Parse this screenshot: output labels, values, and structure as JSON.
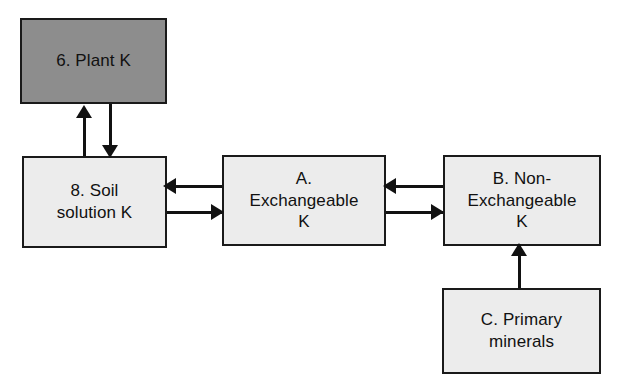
{
  "diagram": {
    "canvas": {
      "width": 622,
      "height": 390,
      "background": "#ffffff"
    },
    "palette": {
      "node_fill_plain": "#ececec",
      "node_fill_shaded": "#8d8d8d",
      "node_border": "#1a1a1a",
      "connector": "#111111",
      "text": "#111111"
    },
    "nodes": [
      {
        "id": "plant",
        "label": "6. Plant  K",
        "fill": "shaded"
      },
      {
        "id": "soil",
        "label": "8. Soil\nsolution K",
        "fill": "plain"
      },
      {
        "id": "exchangeable",
        "label": "A.\nExchangeable\nK",
        "fill": "plain"
      },
      {
        "id": "nonexchangeable",
        "label": "B. Non-\nExchangeable\nK",
        "fill": "plain"
      },
      {
        "id": "primary",
        "label": "C. Primary\nminerals",
        "fill": "plain"
      }
    ],
    "edges": [
      {
        "id": "soil-to-plant",
        "from": "soil",
        "to": "plant",
        "direction": "up"
      },
      {
        "id": "plant-to-soil",
        "from": "plant",
        "to": "soil",
        "direction": "down"
      },
      {
        "id": "exchangeable-to-soil",
        "from": "exchangeable",
        "to": "soil",
        "direction": "left"
      },
      {
        "id": "soil-to-exchangeable",
        "from": "soil",
        "to": "exchangeable",
        "direction": "right"
      },
      {
        "id": "nonexchangeable-to-exchangeable",
        "from": "nonexchangeable",
        "to": "exchangeable",
        "direction": "left"
      },
      {
        "id": "exchangeable-to-nonexchangeable",
        "from": "exchangeable",
        "to": "nonexchangeable",
        "direction": "right"
      },
      {
        "id": "primary-to-nonexchangeable",
        "from": "primary",
        "to": "nonexchangeable",
        "direction": "up"
      }
    ]
  }
}
